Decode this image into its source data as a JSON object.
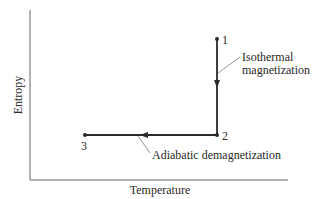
{
  "diagram": {
    "axes": {
      "x_label": "Temperature",
      "y_label": "Entropy"
    },
    "points": [
      {
        "id": "1",
        "label": "1",
        "x": 217,
        "y": 39
      },
      {
        "id": "2",
        "label": "2",
        "x": 217,
        "y": 135
      },
      {
        "id": "3",
        "label": "3",
        "x": 85,
        "y": 135
      }
    ],
    "processes": [
      {
        "from": "1",
        "to": "2",
        "label_line1": "Isothermal",
        "label_line2": "magnetization"
      },
      {
        "from": "2",
        "to": "3",
        "label": "Adiabatic demagnetization"
      }
    ],
    "colors": {
      "line": "#2a2a2a",
      "axis": "#555555",
      "leader": "#777777"
    }
  }
}
